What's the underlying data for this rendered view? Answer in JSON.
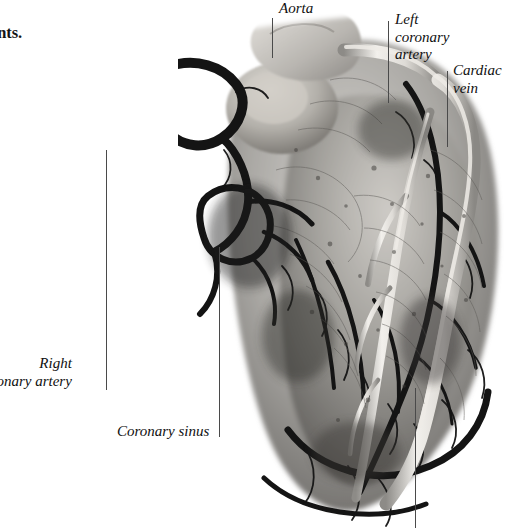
{
  "page": {
    "width": 520,
    "height": 528,
    "background_color": "#ffffff",
    "text_color": "#141414",
    "leader_line_color": "#4a4a4a"
  },
  "body_text": {
    "paragraph_1": "ound the body,\ngen and nutrients.\n the septum,\nnwise into\nalve divides\nbers: an\nhen the\nod",
    "paragraph_2": "lungs\ne left\nhen\n.\ne body\natrium,\nut\nor",
    "paragraph_3": "e."
  },
  "labels": {
    "aorta": "Aorta",
    "left_coronary_artery": "Left\ncoronary\nartery",
    "cardiac_vein": "Cardiac\nvein",
    "right_coronary_artery": "Right\ncoronary artery",
    "coronary_sinus": "Coronary sinus"
  },
  "figure": {
    "caption": "",
    "type": "photograph"
  }
}
